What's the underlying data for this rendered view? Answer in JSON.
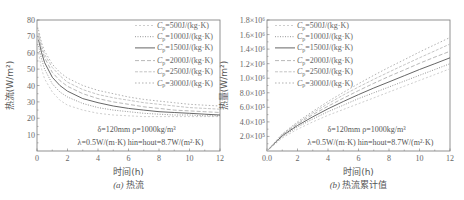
{
  "chart_data": [
    {
      "type": "line",
      "panel": "a",
      "caption_prefix": "(a)",
      "caption": "热流",
      "xlabel": "时间(h)",
      "ylabel": "热流(W/m²)",
      "xlim": [
        0,
        12
      ],
      "ylim": [
        0,
        80
      ],
      "xticks": [
        "0",
        "2",
        "4",
        "6",
        "8",
        "10",
        "12"
      ],
      "yticks": [
        "10",
        "20",
        "30",
        "40",
        "50",
        "60",
        "70",
        "80"
      ],
      "annotation_line1": "δ=120mm  ρ=1000kg/m³",
      "annotation_line2": "λ=0.5W/(m·K)  hin=hout=8.7W/(m²·K)",
      "legend": [
        "Cp=500J/(kg·K)",
        "Cp=1000J/(kg·K)",
        "Cp=1500J/(kg·K)",
        "Cp=2000J/(kg·K)",
        "Cp=2500J/(kg·K)",
        "Cp=3000J/(kg·K)"
      ],
      "x": [
        0.1,
        0.3,
        0.5,
        1,
        1.5,
        2,
        3,
        4,
        5,
        6,
        7,
        8,
        9,
        10,
        11,
        12
      ],
      "series": [
        {
          "name": "Cp=500J/(kg·K)",
          "values": [
            60,
            50,
            44,
            36,
            31,
            28,
            25,
            23,
            22,
            21.5,
            21,
            21,
            21,
            21,
            21,
            21
          ]
        },
        {
          "name": "Cp=1000J/(kg·K)",
          "values": [
            64,
            56,
            50,
            41,
            36,
            33,
            29,
            26.5,
            25,
            24,
            23,
            22.5,
            22,
            22,
            21.5,
            21.5
          ]
        },
        {
          "name": "Cp=1500J/(kg·K)",
          "values": [
            68,
            60,
            54,
            45,
            40,
            36.5,
            32,
            29.5,
            27.5,
            26,
            25,
            24,
            23.5,
            23,
            22.5,
            22
          ]
        },
        {
          "name": "Cp=2000J/(kg·K)",
          "values": [
            70,
            62,
            57,
            48,
            43,
            39.5,
            35,
            32,
            30,
            28.5,
            27,
            26,
            25,
            24.5,
            24,
            23.5
          ]
        },
        {
          "name": "Cp=2500J/(kg·K)",
          "values": [
            72,
            64,
            59,
            51,
            46,
            42,
            37.5,
            34.5,
            32.5,
            31,
            29.5,
            28.5,
            27.5,
            26.5,
            26,
            25.5
          ]
        },
        {
          "name": "Cp=3000J/(kg·K)",
          "values": [
            74,
            66,
            61,
            53,
            48,
            44.5,
            40,
            37,
            35,
            33,
            31.5,
            30.5,
            29.5,
            28.5,
            28,
            27.5
          ]
        }
      ]
    },
    {
      "type": "line",
      "panel": "b",
      "caption_prefix": "(b)",
      "caption": "热流累计值",
      "xlabel": "时间(h)",
      "ylabel": "热量(W/m²)",
      "xlim": [
        0,
        12
      ],
      "ylim": [
        0,
        1800000
      ],
      "xticks": [
        "0.0",
        "2",
        "4",
        "6",
        "8",
        "10",
        "12"
      ],
      "yticks": [
        "2.0×10⁵",
        "4.0×10⁵",
        "6.0×10⁵",
        "8.0×10⁵",
        "1.0×10⁶",
        "1.2×10⁶",
        "1.4×10⁶",
        "1.6×10⁶",
        "1.8×10⁶"
      ],
      "annotation_line1": "δ=120mm  ρ=1000kg/m³",
      "annotation_line2": "λ=0.5W/(m·K)  hin=hout=8.7W/(m²·K)",
      "legend": [
        "Cp=500J/(kg·K)",
        "Cp=1000J/(kg·K)",
        "Cp=1500J/(kg·K)",
        "Cp=2000J/(kg·K)",
        "Cp=2500J/(kg·K)",
        "Cp=3000J/(kg·K)"
      ],
      "x": [
        0,
        1,
        2,
        3,
        4,
        5,
        6,
        7,
        8,
        9,
        10,
        11,
        12
      ],
      "series": [
        {
          "name": "Cp=500J/(kg·K)",
          "values": [
            0,
            180000,
            300000,
            400000,
            490000,
            570000,
            650000,
            730000,
            810000,
            890000,
            970000,
            1050000,
            1130000
          ]
        },
        {
          "name": "Cp=1000J/(kg·K)",
          "values": [
            0,
            195000,
            330000,
            440000,
            540000,
            630000,
            720000,
            800000,
            880000,
            960000,
            1040000,
            1120000,
            1200000
          ]
        },
        {
          "name": "Cp=1500J/(kg·K)",
          "values": [
            0,
            210000,
            350000,
            470000,
            580000,
            680000,
            775000,
            865000,
            950000,
            1035000,
            1120000,
            1200000,
            1280000
          ]
        },
        {
          "name": "Cp=2000J/(kg·K)",
          "values": [
            0,
            220000,
            370000,
            500000,
            615000,
            725000,
            830000,
            930000,
            1025000,
            1115000,
            1205000,
            1290000,
            1370000
          ]
        },
        {
          "name": "Cp=2500J/(kg·K)",
          "values": [
            0,
            228000,
            385000,
            525000,
            650000,
            770000,
            880000,
            985000,
            1085000,
            1185000,
            1280000,
            1375000,
            1470000
          ]
        },
        {
          "name": "Cp=3000J/(kg·K)",
          "values": [
            0,
            235000,
            400000,
            545000,
            680000,
            805000,
            925000,
            1040000,
            1150000,
            1255000,
            1360000,
            1460000,
            1560000
          ]
        }
      ]
    }
  ],
  "styles": {
    "axis_color": "#777777",
    "line_colors": [
      "#c8c8c8",
      "#8a8a8a",
      "#555555",
      "#b0b0b0",
      "#bdbdbd",
      "#a8a8a8"
    ],
    "dash": [
      "2,2",
      "1,1.5",
      "",
      "4,2",
      "3,1.5",
      "1.5,2"
    ]
  }
}
